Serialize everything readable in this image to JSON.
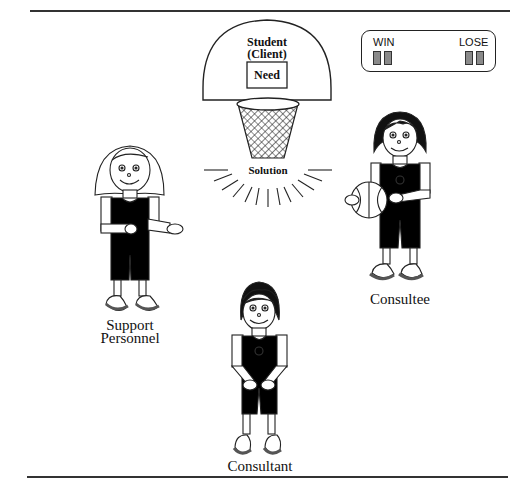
{
  "diagram": {
    "backboard": {
      "title_line1": "Student",
      "title_line2": "(Client)",
      "box_label": "Need"
    },
    "hoop_result_label": "Solution",
    "scoreboard": {
      "win_label": "WIN",
      "lose_label": "LOSE",
      "win_digits": 2,
      "lose_digits": 2
    },
    "figures": [
      {
        "role": "support-personnel",
        "label_line1": "Support",
        "label_line2": "Personnel",
        "hair": "long-light"
      },
      {
        "role": "consultee",
        "label": "Consultee",
        "hair": "dark-bob",
        "holding": "basketball"
      },
      {
        "role": "consultant",
        "label": "Consultant",
        "hair": "dark-short"
      }
    ],
    "colors": {
      "line": "#222222",
      "uniform": "#000000",
      "shoe_sole": "#777777",
      "scoreboard_digit": "#8a8a8a"
    }
  }
}
